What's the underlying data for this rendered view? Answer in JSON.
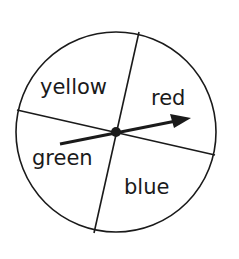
{
  "spinner": {
    "sections": [
      {
        "label": "yellow"
      },
      {
        "label": "red"
      },
      {
        "label": "green"
      },
      {
        "label": "blue"
      }
    ],
    "arrow_points_to": "red",
    "colors": {
      "stroke": "#1a1a1a",
      "background": "#ffffff"
    }
  }
}
